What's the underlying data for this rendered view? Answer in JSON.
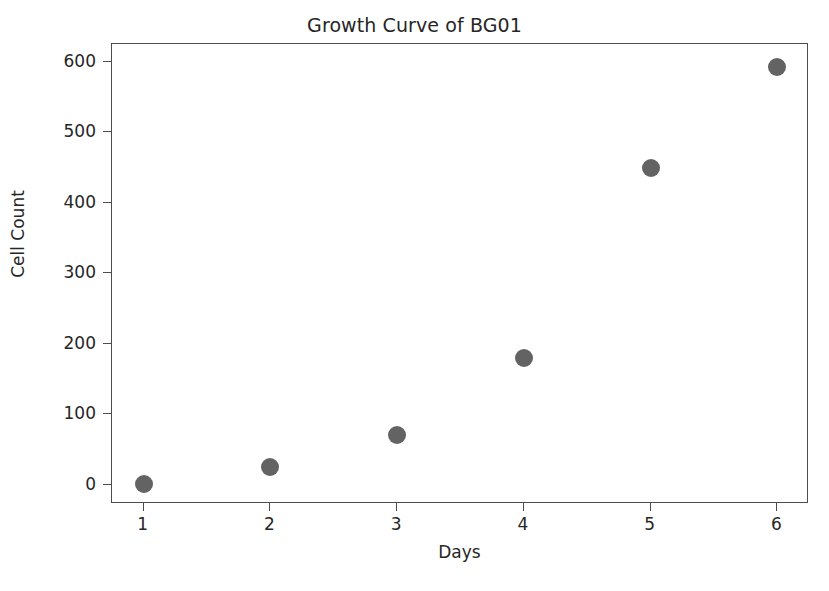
{
  "chart_data": {
    "type": "scatter",
    "title": "Growth Curve of BG01",
    "xlabel": "Days",
    "ylabel": "Cell Count",
    "x": [
      1,
      2,
      3,
      4,
      5,
      6
    ],
    "values": [
      1,
      26,
      71,
      180,
      449,
      592
    ],
    "series": [
      {
        "name": "BG01",
        "x": [
          1,
          2,
          3,
          4,
          5,
          6
        ],
        "values": [
          1,
          26,
          71,
          180,
          449,
          592
        ]
      }
    ],
    "xticks": [
      "1",
      "2",
      "3",
      "4",
      "5",
      "6"
    ],
    "yticks": [
      "0",
      "100",
      "200",
      "300",
      "400",
      "500",
      "600"
    ],
    "xlim": [
      0.75,
      6.25
    ],
    "ylim": [
      -27,
      625
    ],
    "grid": false,
    "legend": null,
    "marker_color": "#636363",
    "axis_color": "#4d4d4d",
    "text_color": "#262626",
    "background_color": "#ffffff"
  }
}
